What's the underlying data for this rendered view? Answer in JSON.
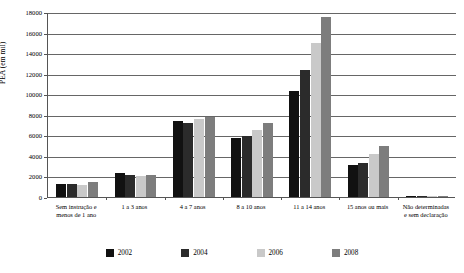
{
  "chart_data": {
    "type": "bar",
    "title": "",
    "xlabel": "",
    "ylabel": "PEA (em mil)",
    "ylim": [
      0,
      18000
    ],
    "ytick_step": 2000,
    "yticks": [
      0,
      2000,
      4000,
      6000,
      8000,
      10000,
      12000,
      14000,
      16000,
      18000
    ],
    "grid": true,
    "legend_position": "bottom",
    "categories": [
      "Sem instrução e\nmenos de 1 ano",
      "1 a 3 anos",
      "4 a 7 anos",
      "8 a 10 anos",
      "11 a 14 anos",
      "15 anos ou mais",
      "Não determinadas\ne sem declaração"
    ],
    "series": [
      {
        "name": "2002",
        "color": "#111111",
        "values": [
          1270,
          2300,
          7400,
          5700,
          10300,
          3100,
          120
        ]
      },
      {
        "name": "2004",
        "color": "#2b2b2b",
        "values": [
          1260,
          2180,
          7250,
          5900,
          12400,
          3300,
          130
        ]
      },
      {
        "name": "2006",
        "color": "#c9c9c9",
        "values": [
          1200,
          2080,
          7600,
          6500,
          15000,
          4200,
          110
        ]
      },
      {
        "name": "2008",
        "color": "#7d7d7d",
        "values": [
          1450,
          2100,
          7750,
          7200,
          17500,
          5000,
          140
        ]
      }
    ]
  },
  "legend": {
    "items": [
      {
        "label": "2002",
        "color": "#111111"
      },
      {
        "label": "2004",
        "color": "#2b2b2b"
      },
      {
        "label": "2006",
        "color": "#c9c9c9"
      },
      {
        "label": "2008",
        "color": "#7d7d7d"
      }
    ]
  }
}
